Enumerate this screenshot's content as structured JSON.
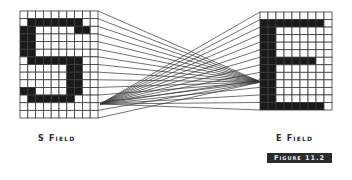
{
  "figure": {
    "badge_label": "Figure 11.2",
    "left_field": {
      "label": "S Field",
      "letter": "S",
      "cols": 10,
      "rows": 14,
      "box": {
        "x": 20,
        "y": 11,
        "w": 78,
        "h": 107
      },
      "filled": [
        "..........",
        ".#######..",
        "##.....##.",
        "##........",
        "##........",
        "##........",
        ".#######..",
        "......##..",
        "......##..",
        "......##..",
        "##....##..",
        ".######...",
        "..........",
        ".........."
      ],
      "convergence_point": {
        "x": 100,
        "y": 104
      }
    },
    "right_field": {
      "label": "E Field",
      "letter": "E",
      "cols": 9,
      "rows": 13,
      "box": {
        "x": 260,
        "y": 12,
        "w": 72,
        "h": 98
      },
      "filled": [
        ".........",
        "########.",
        "##.......",
        "##.......",
        "##.......",
        "##.......",
        "#######..",
        "##.......",
        "##.......",
        "##.......",
        "##.......",
        "##.......",
        "########."
      ],
      "convergence_point": {
        "x": 261,
        "y": 82
      }
    },
    "colors": {
      "ink": "#1a1a1a",
      "grid": "#3a3a3a",
      "line": "#333333",
      "badge_bg": "#2b2b2b",
      "badge_text": "#e8e8e8"
    }
  }
}
